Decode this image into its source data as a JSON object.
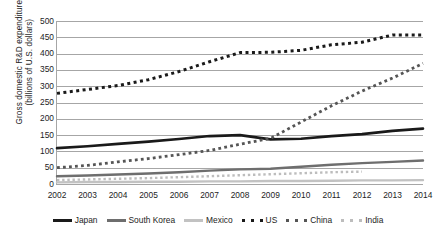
{
  "chart_data": {
    "type": "line",
    "title": "",
    "xlabel": "",
    "ylabel": "Gross domestic R&D expenditure (billions of U.S. dollars)",
    "ylabel_line1": "Gross domestic R&D expenditure",
    "ylabel_line2": "(billions of U.S. dollars)",
    "categories": [
      "2002",
      "2003",
      "2004",
      "2005",
      "2006",
      "2007",
      "2008",
      "2009",
      "2010",
      "2011",
      "2012",
      "2013",
      "2014"
    ],
    "x": [
      2002,
      2003,
      2004,
      2005,
      2006,
      2007,
      2008,
      2009,
      2010,
      2011,
      2012,
      2013,
      2014
    ],
    "ylim": [
      0,
      500
    ],
    "ytick_labels": [
      "0",
      "50",
      "100",
      "150",
      "200",
      "250",
      "300",
      "350",
      "400",
      "450",
      "500"
    ],
    "yticks": [
      0,
      50,
      100,
      150,
      200,
      250,
      300,
      350,
      400,
      450,
      500
    ],
    "grid": true,
    "legend_position": "bottom",
    "series": [
      {
        "name": "Japan",
        "style": "solid",
        "color": "#1a1a1a",
        "width": 2.6,
        "values": [
          110,
          116,
          123,
          130,
          138,
          147,
          150,
          137,
          139,
          147,
          153,
          163,
          170
        ]
      },
      {
        "name": "South Korea",
        "style": "solid",
        "color": "#6e6e6e",
        "width": 2.4,
        "values": [
          24,
          26,
          29,
          32,
          36,
          41,
          45,
          47,
          53,
          59,
          64,
          68,
          72
        ]
      },
      {
        "name": "Mexico",
        "style": "solid",
        "color": "#c2c2c2",
        "width": 2.4,
        "values": [
          5,
          6,
          6,
          7,
          7,
          8,
          8,
          9,
          9,
          10,
          11,
          11,
          12
        ]
      },
      {
        "name": "US",
        "style": "dotted",
        "color": "#1a1a1a",
        "width": 3.0,
        "values": [
          278,
          290,
          302,
          320,
          345,
          375,
          403,
          404,
          410,
          427,
          435,
          457,
          457
        ]
      },
      {
        "name": "China",
        "style": "dotted",
        "color": "#555555",
        "width": 2.8,
        "values": [
          50,
          57,
          68,
          78,
          90,
          103,
          122,
          140,
          190,
          240,
          285,
          325,
          370
        ]
      },
      {
        "name": "India",
        "style": "dotted",
        "color": "#bdbdbd",
        "width": 2.4,
        "values": [
          12,
          14,
          16,
          18,
          21,
          24,
          27,
          30,
          33,
          36,
          38,
          null,
          null
        ]
      }
    ]
  },
  "legend": {
    "items": [
      {
        "label": "Japan",
        "style": "solid",
        "color": "#1a1a1a"
      },
      {
        "label": "South Korea",
        "style": "solid",
        "color": "#6e6e6e"
      },
      {
        "label": "Mexico",
        "style": "solid",
        "color": "#c2c2c2"
      },
      {
        "label": "US",
        "style": "dotted",
        "color": "#1a1a1a"
      },
      {
        "label": "China",
        "style": "dotted",
        "color": "#555555"
      },
      {
        "label": "India",
        "style": "dotted",
        "color": "#bdbdbd"
      }
    ]
  },
  "colors": {
    "gridline": "#a6a6a6",
    "text": "#1d1d1d",
    "background": "#ffffff"
  }
}
